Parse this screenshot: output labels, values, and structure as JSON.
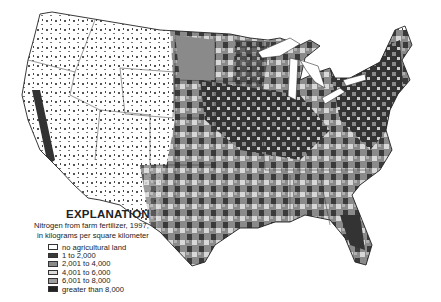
{
  "map": {
    "subject": "Nitrogen from farm fertilizer, 1997, conterminous United States",
    "base_colors": {
      "background": "#ffffff",
      "outline": "#333333"
    }
  },
  "legend": {
    "title": "EXPLANATION",
    "subtitle_line1": "Nitrogen from farm fertilizer, 1997,",
    "subtitle_line2": "in kilograms per square kilometer",
    "items": [
      {
        "label": "no agricultural land",
        "color": "#ffffff"
      },
      {
        "label": "1 to 2,000",
        "color": "#3a3a3a"
      },
      {
        "label": "2,001 to 4,000",
        "color": "#8a8a8a"
      },
      {
        "label": "4,001 to 6,000",
        "color": "#dcdcdc"
      },
      {
        "label": "6,001 to 8,000",
        "color": "#9e9e9e"
      },
      {
        "label": "greater than 8,000",
        "color": "#222222"
      }
    ]
  }
}
